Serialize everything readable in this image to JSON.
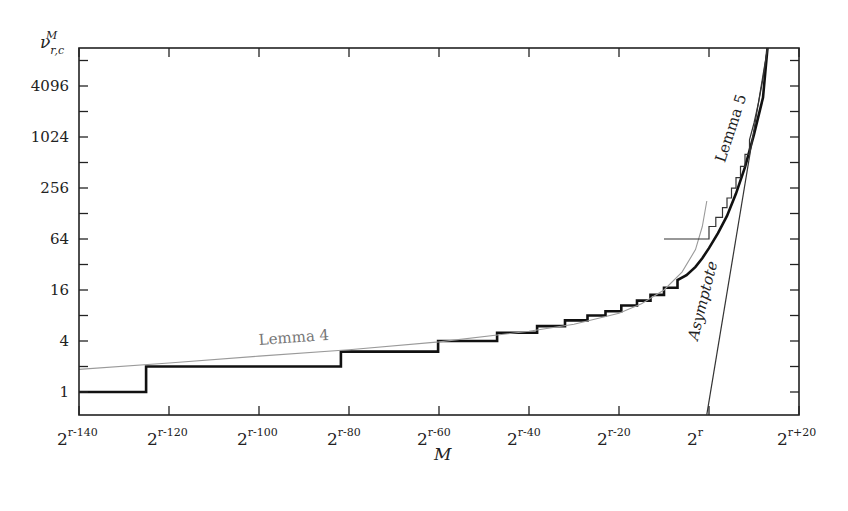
{
  "chart_data": {
    "type": "line",
    "title": "",
    "xlabel": "M",
    "ylabel": "ν_{r,c}^M",
    "xscale": "log2 (exponent relative to r)",
    "yscale": "log2",
    "x_range": [
      -140,
      20
    ],
    "y_range_log2": [
      -0.9,
      13.5
    ],
    "x_ticks": [
      {
        "value": -140,
        "base": "2",
        "exp": "r-140"
      },
      {
        "value": -120,
        "base": "2",
        "exp": "r-120"
      },
      {
        "value": -100,
        "base": "2",
        "exp": "r-100"
      },
      {
        "value": -80,
        "base": "2",
        "exp": "r-80"
      },
      {
        "value": -60,
        "base": "2",
        "exp": "r-60"
      },
      {
        "value": -40,
        "base": "2",
        "exp": "r-40"
      },
      {
        "value": -20,
        "base": "2",
        "exp": "r-20"
      },
      {
        "value": 0,
        "base": "2",
        "exp": "r"
      },
      {
        "value": 20,
        "base": "2",
        "exp": "r+20"
      }
    ],
    "y_ticks": [
      1,
      4,
      16,
      64,
      256,
      1024,
      4096
    ],
    "y_minor_ticks": [
      2,
      8,
      32,
      128,
      512,
      2048,
      8192
    ],
    "grid": false,
    "legend": "none (inline curve labels)",
    "annotations": [
      {
        "text": "Lemma 4",
        "x": -100,
        "y": 3.6,
        "rotate": -4
      },
      {
        "text": "Lemma 5",
        "x": 3.5,
        "y": 500,
        "rotate": -72
      },
      {
        "text": "Asymptote",
        "x": -2.5,
        "y": 4,
        "rotate": -76
      }
    ],
    "series": [
      {
        "name": "Exact value (step function)",
        "style": "thick-black",
        "points": [
          [
            -140,
            1
          ],
          [
            -125.1,
            1
          ],
          [
            -125.1,
            2
          ],
          [
            -81.8,
            2
          ],
          [
            -81.8,
            3
          ],
          [
            -60.2,
            3
          ],
          [
            -60.2,
            4
          ],
          [
            -47.1,
            4
          ],
          [
            -47.1,
            5
          ],
          [
            -38.2,
            5
          ],
          [
            -38.2,
            6
          ],
          [
            -32,
            6
          ],
          [
            -32,
            7
          ],
          [
            -27,
            7
          ],
          [
            -27,
            8
          ],
          [
            -23,
            8
          ],
          [
            -23,
            9
          ],
          [
            -19.5,
            9
          ],
          [
            -19.5,
            10.5
          ],
          [
            -16,
            10.5
          ],
          [
            -16,
            12
          ],
          [
            -13,
            12
          ],
          [
            -13,
            14
          ],
          [
            -10,
            14
          ],
          [
            -10,
            17
          ],
          [
            -7,
            17
          ],
          [
            -7,
            21
          ],
          [
            -5,
            24
          ],
          [
            -3,
            30
          ],
          [
            -1.5,
            38
          ],
          [
            0,
            50
          ],
          [
            2,
            75
          ],
          [
            4,
            120
          ],
          [
            6,
            220
          ],
          [
            8,
            450
          ],
          [
            10,
            1100
          ],
          [
            12,
            3000
          ],
          [
            13,
            11585
          ]
        ]
      },
      {
        "name": "Lemma 4",
        "style": "thin-gray",
        "points": [
          [
            -140,
            1.85
          ],
          [
            -120,
            2.2
          ],
          [
            -100,
            2.65
          ],
          [
            -80,
            3.15
          ],
          [
            -60,
            3.9
          ],
          [
            -40,
            5.2
          ],
          [
            -30,
            6.3
          ],
          [
            -20,
            8.5
          ],
          [
            -15,
            11
          ],
          [
            -10,
            16
          ],
          [
            -6,
            26
          ],
          [
            -3,
            48
          ],
          [
            -1.5,
            90
          ],
          [
            -0.5,
            180
          ]
        ]
      },
      {
        "name": "Lemma 5",
        "style": "thin-dark",
        "points": [
          [
            -10,
            64
          ],
          [
            0,
            64
          ],
          [
            0,
            90
          ],
          [
            1.5,
            90
          ],
          [
            1.5,
            115
          ],
          [
            3,
            115
          ],
          [
            3,
            150
          ],
          [
            4,
            150
          ],
          [
            4,
            195
          ],
          [
            5,
            195
          ],
          [
            5,
            255
          ],
          [
            6,
            255
          ],
          [
            6,
            340
          ],
          [
            7,
            340
          ],
          [
            7,
            460
          ],
          [
            8,
            460
          ],
          [
            8,
            640
          ],
          [
            9,
            640
          ],
          [
            9,
            950
          ],
          [
            10,
            1500
          ],
          [
            11,
            2600
          ],
          [
            12,
            5000
          ],
          [
            13,
            11585
          ]
        ]
      },
      {
        "name": "Asymptote",
        "style": "thin-dark",
        "points": [
          [
            -0.5,
            0.54
          ],
          [
            13,
            11585
          ]
        ]
      }
    ]
  },
  "axes": {
    "y_title_base": "ν",
    "y_title_sup": "M",
    "y_title_sub": "r,c",
    "x_title": "M"
  }
}
